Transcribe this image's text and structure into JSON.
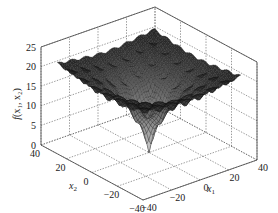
{
  "chart_data": {
    "type": "surface3d",
    "title": "",
    "function_shape": "Ackley-like multimodal surface: plateau near 20-22 with regular egg-crate bumps, sharp funnel down to 0 at origin",
    "xlabel": "x1",
    "ylabel": "x2",
    "zlabel": "f(x1, x2)",
    "xlim": [
      -40,
      40
    ],
    "ylim": [
      -40,
      40
    ],
    "zlim": [
      0,
      25
    ],
    "x_ticks": [
      "-40",
      "-20",
      "0",
      "20",
      "40"
    ],
    "y_ticks": [
      "40",
      "20",
      "0",
      "-20",
      "-40"
    ],
    "z_ticks": [
      "0",
      "5",
      "10",
      "15",
      "20",
      "25"
    ],
    "grid": true,
    "colormap": "grayscale (dark mesh, lighter near central funnel)",
    "global_minimum": {
      "x1": 0,
      "x2": 0,
      "f": 0
    },
    "plateau_value_approx": 21
  },
  "labels": {
    "zlabel_main": "f",
    "zlabel_args": "(x₁, x₂)",
    "xlabel_main": "x",
    "xlabel_sub": "1",
    "ylabel_main": "x",
    "ylabel_sub": "2"
  }
}
